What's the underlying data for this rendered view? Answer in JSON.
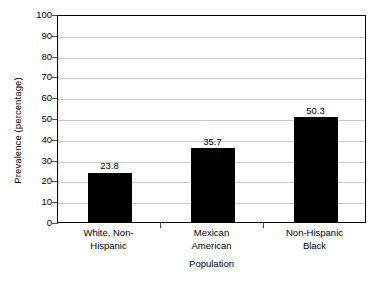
{
  "chart_data": {
    "type": "bar",
    "title": "",
    "subtitle": "",
    "categories": [
      "White, Non-\nHispanic",
      "Mexican\nAmerican",
      "Non-Hispanic\nBlack"
    ],
    "values": [
      23.8,
      35.7,
      50.3
    ],
    "value_labels": [
      "23.8",
      "35.7",
      "50.3"
    ],
    "xlabel": "Population",
    "ylabel": "Prevalence (percentage)",
    "ylim": [
      0,
      100
    ],
    "ytick_labels": [
      "100",
      "90",
      "80",
      "70",
      "60",
      "50",
      "40",
      "30",
      "20",
      "10",
      "0"
    ],
    "ytick_values": [
      100,
      90,
      80,
      70,
      60,
      50,
      40,
      30,
      20,
      10,
      0
    ],
    "grid": "horizontal",
    "legend": "none",
    "bar_color": "#000000",
    "grid_color": "#c9c9c9",
    "frame_color": "#000000",
    "background_color": "#ffffff"
  }
}
